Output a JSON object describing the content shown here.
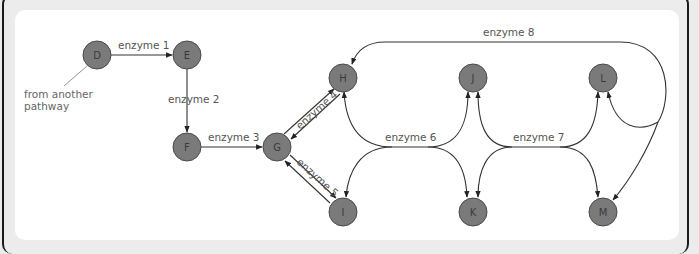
{
  "diagram": {
    "nodes": [
      {
        "id": "D",
        "label": "D"
      },
      {
        "id": "E",
        "label": "E"
      },
      {
        "id": "F",
        "label": "F"
      },
      {
        "id": "G",
        "label": "G"
      },
      {
        "id": "H",
        "label": "H"
      },
      {
        "id": "I",
        "label": "I"
      },
      {
        "id": "J",
        "label": "J"
      },
      {
        "id": "K",
        "label": "K"
      },
      {
        "id": "L",
        "label": "L"
      },
      {
        "id": "M",
        "label": "M"
      }
    ],
    "enzymes": {
      "e1": "enzyme 1",
      "e2": "enzyme 2",
      "e3": "enzyme 3",
      "e4": "enzyme 4",
      "e5": "enzyme 5",
      "e6": "enzyme 6",
      "e7": "enzyme 7",
      "e8": "enzyme 8"
    },
    "edges": [
      {
        "from": "D",
        "to": "E",
        "enzyme": "enzyme 1"
      },
      {
        "from": "E",
        "to": "F",
        "enzyme": "enzyme 2"
      },
      {
        "from": "F",
        "to": "G",
        "enzyme": "enzyme 3"
      },
      {
        "from": "G",
        "to": "H",
        "enzyme": "enzyme 4",
        "reversible": true
      },
      {
        "from": "G",
        "to": "I",
        "enzyme": "enzyme 5",
        "reversible": true
      },
      {
        "from": "H/I",
        "to": "J/K",
        "enzyme": "enzyme 6",
        "note": "H + J <-> I + K"
      },
      {
        "from": "J/K",
        "to": "L/M",
        "enzyme": "enzyme 7",
        "note": "J + L <-> K + M"
      },
      {
        "from": "L",
        "to": "H/M",
        "enzyme": "enzyme 8"
      }
    ],
    "annotation": {
      "line1": "from another",
      "line2": "pathway"
    }
  }
}
